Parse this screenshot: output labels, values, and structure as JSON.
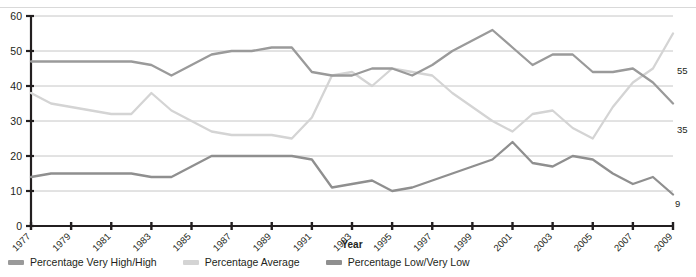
{
  "chart_data": {
    "type": "line",
    "title": "",
    "xlabel": "Year",
    "ylabel": "",
    "ylim": [
      0,
      60
    ],
    "yticks": [
      0,
      10,
      20,
      30,
      40,
      50,
      60
    ],
    "grid": true,
    "legend_position": "bottom",
    "x": [
      1977,
      1978,
      1979,
      1980,
      1981,
      1982,
      1983,
      1984,
      1985,
      1986,
      1987,
      1988,
      1989,
      1990,
      1991,
      1992,
      1993,
      1994,
      1995,
      1996,
      1997,
      1998,
      1999,
      2000,
      2001,
      2002,
      2003,
      2004,
      2005,
      2006,
      2007,
      2008,
      2009
    ],
    "xtick_labels": [
      "1977",
      "1979",
      "1981",
      "1983",
      "1985",
      "1987",
      "1989",
      "1991",
      "1993",
      "1995",
      "1997",
      "1999",
      "2001",
      "2003",
      "2005",
      "2007",
      "2009"
    ],
    "series": [
      {
        "name": "Percentage Very High/High",
        "color": "#9a9a9a",
        "values": [
          47,
          47,
          47,
          47,
          47,
          47,
          46,
          43,
          46,
          49,
          50,
          50,
          51,
          51,
          44,
          43,
          43,
          45,
          45,
          43,
          46,
          50,
          53,
          56,
          51,
          46,
          49,
          49,
          44,
          44,
          45,
          41,
          35
        ],
        "end_label": "35"
      },
      {
        "name": "Percentage Average",
        "color": "#d4d4d4",
        "values": [
          38,
          35,
          34,
          33,
          32,
          32,
          38,
          33,
          30,
          27,
          26,
          26,
          26,
          25,
          31,
          43,
          44,
          40,
          45,
          44,
          43,
          38,
          34,
          30,
          27,
          32,
          33,
          28,
          25,
          34,
          41,
          45,
          55
        ],
        "end_label": "55"
      },
      {
        "name": "Percentage Low/Very Low",
        "color": "#8f8f8f",
        "values": [
          14,
          15,
          15,
          15,
          15,
          15,
          14,
          14,
          17,
          20,
          20,
          20,
          20,
          20,
          19,
          11,
          12,
          13,
          10,
          11,
          13,
          15,
          17,
          19,
          24,
          18,
          17,
          20,
          19,
          15,
          12,
          14,
          9
        ],
        "end_label": "9"
      }
    ],
    "end_labels": [
      {
        "text": "55",
        "value": 55
      },
      {
        "text": "35",
        "value": 35
      },
      {
        "text": "9",
        "value": 9
      }
    ]
  },
  "legend": {
    "items": [
      {
        "label": "Percentage Very High/High",
        "color": "#9a9a9a"
      },
      {
        "label": "Percentage Average",
        "color": "#d4d4d4"
      },
      {
        "label": "Percentage Low/Very Low",
        "color": "#8f8f8f"
      }
    ]
  }
}
